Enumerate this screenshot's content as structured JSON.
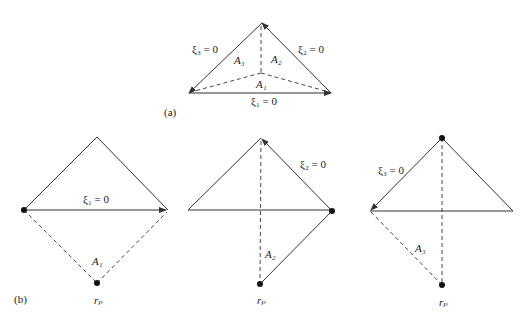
{
  "panel_a": {
    "caption": "(a)",
    "edge_labels": {
      "xi1": "ξ₁ = 0",
      "xi2": "ξ₂ = 0",
      "xi3": "ξ₃ = 0"
    },
    "area_labels": {
      "A1": "A₁",
      "A2": "A₂",
      "A3": "A₃"
    }
  },
  "panel_b": {
    "caption": "(b)",
    "subpanels": [
      {
        "edge_label": "ξ₁ = 0",
        "area_label": "A₁",
        "point_label": "rₚ"
      },
      {
        "edge_label": "ξ₂ = 0",
        "area_label": "A₂",
        "point_label": "rₚ"
      },
      {
        "edge_label": "ξ₃ = 0",
        "area_label": "A₃",
        "point_label": "rₚ"
      }
    ]
  },
  "colors": {
    "line": "#333333",
    "background": "#ffffff"
  }
}
